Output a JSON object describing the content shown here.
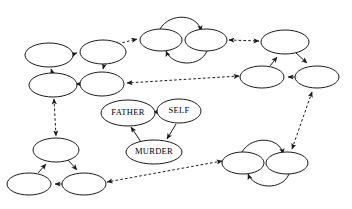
{
  "diagram": {
    "background_color": "#ffffff",
    "stroke_color": "#1a1a1a",
    "width": 352,
    "height": 209,
    "labeled_nodes": [
      {
        "id": "father",
        "label": "FATHER",
        "cx": 128,
        "cy": 113,
        "rx": 27,
        "ry": 13
      },
      {
        "id": "self",
        "label": "SELF",
        "cx": 179,
        "cy": 111,
        "rx": 22,
        "ry": 12
      },
      {
        "id": "murder",
        "label": "MURDER",
        "cx": 154,
        "cy": 152,
        "rx": 28,
        "ry": 12
      }
    ],
    "clusters": [
      {
        "id": "upper-left-quad",
        "name": "upper-left-cluster",
        "node_count": 4,
        "nodes": [
          {
            "id": "ul-a",
            "cx": 49,
            "cy": 55,
            "rx": 24,
            "ry": 12
          },
          {
            "id": "ul-b",
            "cx": 103,
            "cy": 52,
            "rx": 23,
            "ry": 12
          },
          {
            "id": "ul-c",
            "cx": 53,
            "cy": 85,
            "rx": 24,
            "ry": 12
          },
          {
            "id": "ul-d",
            "cx": 102,
            "cy": 84,
            "rx": 22,
            "ry": 12
          }
        ]
      },
      {
        "id": "top-center-pair",
        "name": "top-center-cluster",
        "node_count": 2,
        "nodes": [
          {
            "id": "tc-a",
            "cx": 161,
            "cy": 40,
            "rx": 21,
            "ry": 11
          },
          {
            "id": "tc-b",
            "cx": 206,
            "cy": 40,
            "rx": 21,
            "ry": 11
          }
        ]
      },
      {
        "id": "right-triangle",
        "name": "right-cluster",
        "node_count": 3,
        "nodes": [
          {
            "id": "r-top",
            "cx": 285,
            "cy": 42,
            "rx": 24,
            "ry": 12
          },
          {
            "id": "r-left",
            "cx": 262,
            "cy": 77,
            "rx": 22,
            "ry": 11
          },
          {
            "id": "r-right",
            "cx": 317,
            "cy": 77,
            "rx": 22,
            "ry": 11
          }
        ]
      },
      {
        "id": "bottom-right-pair",
        "name": "bottom-right-cluster",
        "node_count": 2,
        "nodes": [
          {
            "id": "br-a",
            "cx": 243,
            "cy": 163,
            "rx": 21,
            "ry": 11
          },
          {
            "id": "br-b",
            "cx": 287,
            "cy": 163,
            "rx": 21,
            "ry": 11
          }
        ]
      },
      {
        "id": "bottom-left-triangle",
        "name": "bottom-left-cluster",
        "node_count": 3,
        "nodes": [
          {
            "id": "bl-top",
            "cx": 56,
            "cy": 150,
            "rx": 23,
            "ry": 12
          },
          {
            "id": "bl-left",
            "cx": 29,
            "cy": 184,
            "rx": 22,
            "ry": 11
          },
          {
            "id": "bl-right",
            "cx": 84,
            "cy": 184,
            "rx": 22,
            "ry": 11
          }
        ]
      }
    ],
    "edge_styles": {
      "intra_cluster": "solid",
      "inter_cluster": "dashed"
    },
    "central_triangle_edges": [
      {
        "from": "FATHER",
        "to": "SELF",
        "direction": "one-way"
      },
      {
        "from": "SELF",
        "to": "MURDER",
        "direction": "one-way"
      },
      {
        "from": "MURDER",
        "to": "FATHER",
        "direction": "one-way"
      }
    ],
    "inter_cluster_edges": [
      {
        "from": "upper-left-cluster",
        "to": "top-center-cluster",
        "direction": "bidirectional"
      },
      {
        "from": "top-center-cluster",
        "to": "right-cluster",
        "direction": "bidirectional"
      },
      {
        "from": "right-cluster",
        "to": "upper-left-cluster",
        "direction": "bidirectional"
      },
      {
        "from": "right-cluster",
        "to": "bottom-right-cluster",
        "direction": "bidirectional"
      },
      {
        "from": "bottom-right-cluster",
        "to": "bottom-left-cluster",
        "direction": "bidirectional"
      },
      {
        "from": "bottom-left-cluster",
        "to": "upper-left-cluster",
        "direction": "bidirectional"
      }
    ]
  }
}
